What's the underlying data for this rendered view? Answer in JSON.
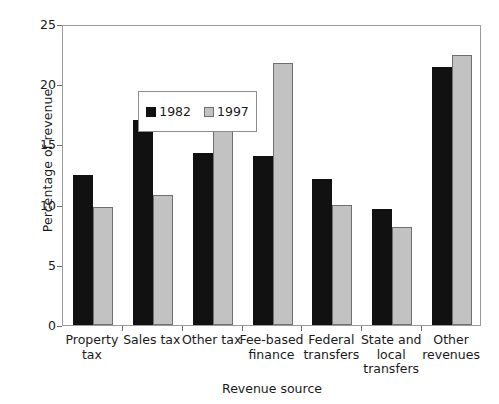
{
  "chart_data": {
    "type": "bar",
    "title": "",
    "xlabel": "Revenue source",
    "ylabel": "Percentage of revenue",
    "categories": [
      "Property tax",
      "Sales tax",
      "Other tax",
      "Fee-based finance",
      "Federal transfers",
      "State and local transfers",
      "Other revenues"
    ],
    "category_lines": [
      [
        "Property",
        "tax"
      ],
      [
        "Sales tax"
      ],
      [
        "Other tax"
      ],
      [
        "Fee-based",
        "finance"
      ],
      [
        "Federal",
        "transfers"
      ],
      [
        "State and",
        "local",
        "transfers"
      ],
      [
        "Other",
        "revenues"
      ]
    ],
    "series": [
      {
        "name": "1982",
        "color": "#111111",
        "values": [
          12.5,
          17.0,
          14.3,
          14.0,
          12.1,
          9.6,
          21.4
        ]
      },
      {
        "name": "1997",
        "color": "#c2c2c2",
        "values": [
          9.8,
          10.8,
          17.8,
          21.8,
          10.0,
          8.1,
          22.4
        ]
      }
    ],
    "ylim": [
      0,
      25
    ],
    "yticks": [
      0,
      5,
      10,
      15,
      20,
      25
    ],
    "ytick_labels": [
      "0",
      "5",
      "10",
      "15",
      "20",
      "25"
    ],
    "grid": false,
    "legend_position": "upper left",
    "legend_entries": [
      "1982",
      "1997"
    ]
  }
}
